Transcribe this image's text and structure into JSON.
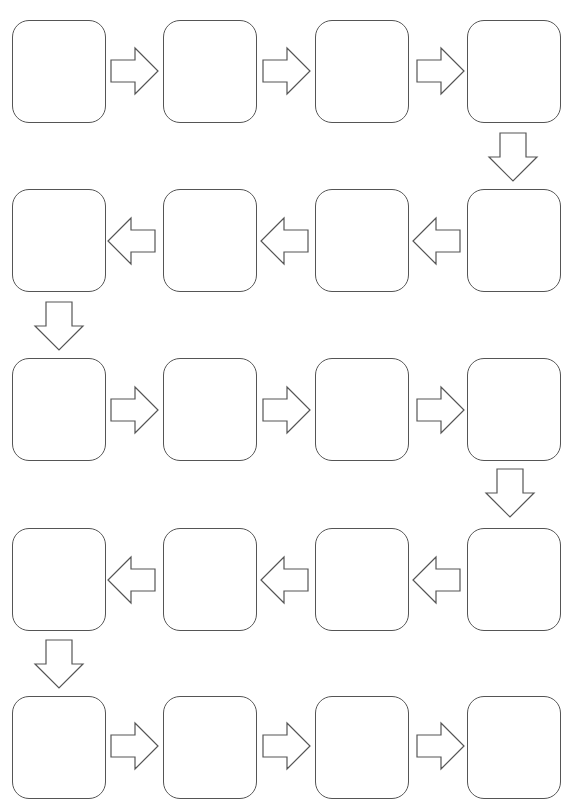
{
  "diagram": {
    "type": "serpentine flow chart",
    "rows": 5,
    "columns": 4,
    "box_labels": [
      "",
      "",
      "",
      "",
      "",
      "",
      "",
      "",
      "",
      "",
      "",
      "",
      "",
      "",
      "",
      "",
      "",
      "",
      "",
      ""
    ],
    "colors": {
      "stroke": "#555555",
      "fill": "#ffffff",
      "background": "#ffffff"
    },
    "flow": [
      {
        "row": 1,
        "direction": "right"
      },
      {
        "row": 2,
        "direction": "left"
      },
      {
        "row": 3,
        "direction": "right"
      },
      {
        "row": 4,
        "direction": "left"
      },
      {
        "row": 5,
        "direction": "right"
      }
    ]
  }
}
